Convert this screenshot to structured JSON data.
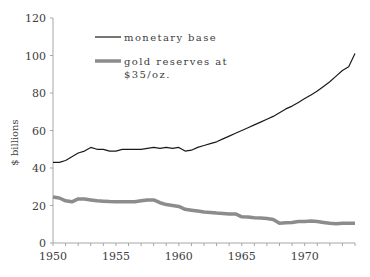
{
  "chart_data": {
    "type": "line",
    "title": "",
    "xlabel": "",
    "ylabel": "$ billions",
    "xlim": [
      1950,
      1974
    ],
    "ylim": [
      0,
      120
    ],
    "x_ticks": [
      "1950",
      "1955",
      "1960",
      "1965",
      "1970"
    ],
    "y_ticks": [
      "0",
      "20",
      "40",
      "60",
      "80",
      "100",
      "120"
    ],
    "grid": false,
    "legend_position": "upper-left-inside",
    "legend": [
      "monetary base",
      "gold reserves at $35/oz."
    ],
    "series": [
      {
        "name": "monetary base",
        "color": "#1a1a1a",
        "x": [
          1950,
          1950.5,
          1951,
          1951.5,
          1952,
          1952.5,
          1953,
          1953.5,
          1954,
          1954.5,
          1955,
          1955.5,
          1956,
          1956.5,
          1957,
          1957.5,
          1958,
          1958.5,
          1959,
          1959.5,
          1960,
          1960.5,
          1961,
          1961.5,
          1962,
          1962.5,
          1963,
          1963.5,
          1964,
          1964.5,
          1965,
          1965.5,
          1966,
          1966.5,
          1967,
          1967.5,
          1968,
          1968.5,
          1969,
          1969.5,
          1970,
          1970.5,
          1971,
          1971.5,
          1972,
          1972.5,
          1973,
          1973.5,
          1974
        ],
        "values": [
          43,
          43,
          44,
          46,
          48,
          49,
          51,
          50,
          50,
          49,
          49,
          50,
          50,
          50,
          50,
          50.5,
          51,
          50.5,
          51,
          50.5,
          51,
          49,
          49.5,
          51,
          52,
          53,
          54,
          55.5,
          57,
          58.5,
          60,
          61.5,
          63,
          64.5,
          66,
          67.5,
          69.5,
          71.5,
          73,
          75,
          77,
          79,
          81,
          83.5,
          86,
          89,
          92,
          94,
          101
        ]
      },
      {
        "name": "gold reserves at $35/oz.",
        "color": "#8c8c8c",
        "x": [
          1950,
          1950.5,
          1951,
          1951.5,
          1952,
          1952.5,
          1953,
          1953.5,
          1954,
          1954.5,
          1955,
          1955.5,
          1956,
          1956.5,
          1957,
          1957.5,
          1958,
          1958.5,
          1959,
          1959.5,
          1960,
          1960.5,
          1961,
          1961.5,
          1962,
          1962.5,
          1963,
          1963.5,
          1964,
          1964.5,
          1965,
          1965.5,
          1966,
          1966.5,
          1967,
          1967.5,
          1968,
          1968.5,
          1969,
          1969.5,
          1970,
          1970.5,
          1971,
          1971.5,
          1972,
          1972.5,
          1973,
          1973.5,
          1974
        ],
        "values": [
          24.5,
          24,
          22.5,
          22,
          23.5,
          23.5,
          23,
          22.5,
          22.3,
          22.1,
          22,
          22,
          22,
          22,
          22.5,
          23,
          23,
          21.5,
          20.5,
          20,
          19.5,
          18,
          17.5,
          17,
          16.5,
          16.3,
          16,
          15.8,
          15.5,
          15.5,
          14,
          13.8,
          13.5,
          13.3,
          13,
          12.5,
          10.5,
          10.8,
          11,
          11.5,
          11.5,
          11.8,
          11.5,
          11,
          10.5,
          10.3,
          10.5,
          10.5,
          10.5
        ]
      }
    ]
  }
}
